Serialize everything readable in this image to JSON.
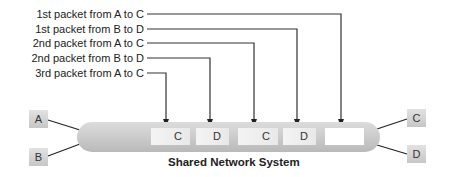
{
  "labels": [
    "1st packet from A to C",
    "1st packet from B to D",
    "2nd packet from A to C",
    "2nd packet from B to D",
    "3rd packet from A to C"
  ],
  "nodes": {
    "left": [
      "A",
      "B"
    ],
    "right": [
      "C",
      "D"
    ]
  },
  "packets": [
    "C",
    "D",
    "C",
    "D",
    ""
  ],
  "network_label": "Shared Network System",
  "colors": {
    "line": "#222222",
    "band": "#cdcdcd",
    "packet": "#eeeeee",
    "node": "#d4d4d4"
  }
}
